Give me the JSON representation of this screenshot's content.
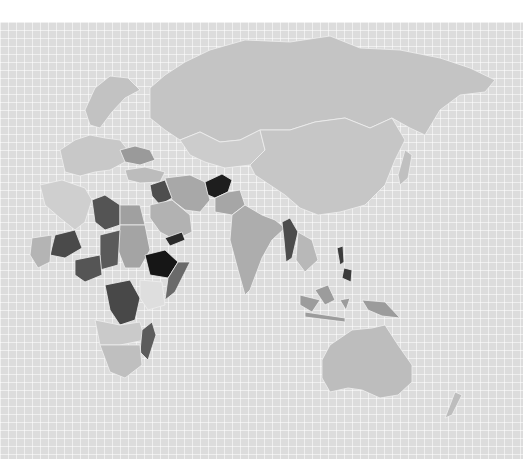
{
  "map": {
    "type": "choropleth",
    "region": "Europe, Africa, Asia and Oceania",
    "color_scale": [
      "#e6e6e6",
      "#c8c8c8",
      "#a9a9a9",
      "#8a8a8a",
      "#5f5f5f",
      "#3a3a3a",
      "#1c1c1c"
    ],
    "background": "#dcdcdc",
    "gridline": "#f2f2f2",
    "border": "#efefef"
  }
}
